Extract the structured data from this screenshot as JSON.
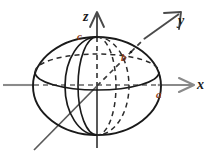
{
  "figure": {
    "type": "3d-axes-ellipsoid-diagram",
    "background_color": "#ffffff",
    "width": 212,
    "height": 156
  },
  "colors": {
    "axis_dark": "#1a1a1a",
    "axis_gray": "#8a8a8a",
    "outline": "#1a1a1a",
    "semi_axis_label": "#8c3a17",
    "hidden_dash": "#2b2b2b",
    "background": "#ffffff"
  },
  "axes": [
    {
      "name": "z-axis",
      "label": "z",
      "direction": "up",
      "arrow": true,
      "style": "solid",
      "color": "#4a4a4a"
    },
    {
      "name": "y-axis",
      "label": "y",
      "direction": "up-right",
      "arrow": true,
      "style": "solid",
      "color": "#4a4a4a"
    },
    {
      "name": "x-axis",
      "label": "x",
      "direction": "right",
      "arrow": true,
      "style": "solid",
      "color": "#8a8a8a"
    }
  ],
  "labels": {
    "z": "z",
    "y": "y",
    "x": "x",
    "a": "a",
    "b": "b",
    "c": "c"
  },
  "semi_axes": [
    {
      "symbol": "a",
      "axis": "x",
      "description": "semi-axis along x at ellipsoid surface"
    },
    {
      "symbol": "b",
      "axis": "y",
      "description": "semi-axis along y at ellipsoid surface"
    },
    {
      "symbol": "c",
      "axis": "z",
      "description": "semi-axis along z at ellipsoid top"
    }
  ],
  "geometry": {
    "center": {
      "x": 97,
      "y": 85
    },
    "outer_ellipse": {
      "cx": 97,
      "cy": 86,
      "rx": 64,
      "ry": 49
    },
    "equator_ellipse": {
      "cx": 97,
      "cy": 72,
      "rx": 62,
      "ry": 18
    },
    "meridian_xz_ellipse": {
      "cx": 97,
      "cy": 86,
      "rx": 32,
      "ry": 49
    },
    "meridian_yz_ellipse": {
      "cx": 97,
      "cy": 86,
      "rx": 18,
      "ry": 49
    }
  }
}
